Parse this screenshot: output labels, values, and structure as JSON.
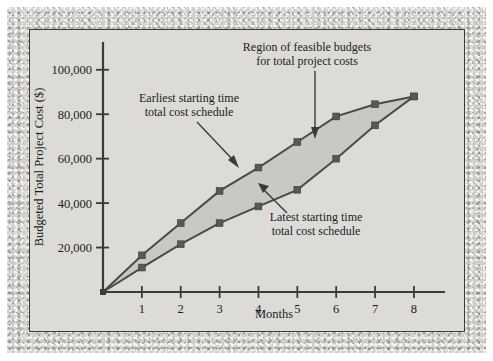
{
  "figure": {
    "background_color": "#dcdbd7",
    "border_color": "#3a3a3c",
    "band_fill_color": "#c9c8c3",
    "line_color": "#4a4a4c",
    "marker_color": "#585859"
  },
  "annotations": {
    "region": {
      "line1": "Region of feasible budgets",
      "line2": "for total project costs"
    },
    "earliest": {
      "line1": "Earliest starting time",
      "line2": "total cost schedule"
    },
    "latest": {
      "line1": "Latest starting time",
      "line2": "total cost schedule"
    }
  },
  "axes": {
    "x_label": "Months",
    "y_label": "Budgeted Total Project Cost ($)",
    "x_ticks": [
      "1",
      "2",
      "3",
      "4",
      "5",
      "6",
      "7",
      "8"
    ],
    "y_ticks": [
      "20,000",
      "40,000",
      "60,000",
      "80,000",
      "100,000"
    ]
  },
  "chart_data": {
    "type": "line",
    "title": "",
    "subtitle": "",
    "xlabel": "Months",
    "ylabel": "Budgeted Total Project Cost ($)",
    "xlim": [
      0,
      8.8
    ],
    "ylim": [
      0,
      112500
    ],
    "xticks": [
      1,
      2,
      3,
      4,
      5,
      6,
      7,
      8
    ],
    "yticks": [
      20000,
      40000,
      60000,
      80000,
      100000
    ],
    "grid": false,
    "legend": "none",
    "shaded_region": {
      "label": "Region of feasible budgets for total project costs",
      "between_series": [
        "Earliest starting time total cost schedule",
        "Latest starting time total cost schedule"
      ],
      "fill_color": "#c9c8c3"
    },
    "x": [
      0,
      1,
      2,
      3,
      4,
      5,
      6,
      7,
      8
    ],
    "series": [
      {
        "name": "Earliest starting time total cost schedule",
        "values": [
          0,
          16500,
          31000,
          45500,
          56000,
          67500,
          79000,
          84500,
          88000
        ]
      },
      {
        "name": "Latest starting time total cost schedule",
        "values": [
          0,
          11000,
          21500,
          31000,
          38500,
          46000,
          60000,
          75000,
          88000
        ]
      }
    ],
    "annotations": [
      {
        "text": "Region of feasible budgets for total project costs",
        "points_to": [
          5.5,
          67000
        ]
      },
      {
        "text": "Earliest starting time total cost schedule",
        "points_to": [
          3.5,
          51000
        ]
      },
      {
        "text": "Latest starting time total cost schedule",
        "points_to": [
          5.4,
          51500
        ]
      }
    ]
  }
}
